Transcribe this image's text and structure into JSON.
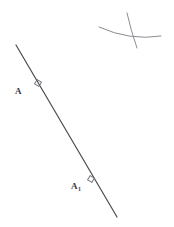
{
  "figure": {
    "background_color": "#ffffff",
    "stroke_color": "#4a4a52",
    "arc_color": "#8c8c94",
    "label_color": "#3a3a42",
    "canvas": {
      "width": 174,
      "height": 227
    },
    "main_line": {
      "name": "main-diagonal-line",
      "x1": 16,
      "y1": 45,
      "x2": 117,
      "y2": 217,
      "stroke_width": 1.2
    },
    "tick_markers": [
      {
        "name": "tick-marker-A",
        "cx": 38,
        "cy": 83,
        "size": 5,
        "rotation": -59
      },
      {
        "name": "tick-marker-A1",
        "cx": 91,
        "cy": 179,
        "size": 5,
        "rotation": -59
      }
    ],
    "labels": [
      {
        "id": "A",
        "base": "A",
        "subscript": "",
        "x": 15,
        "y": 81
      },
      {
        "id": "A1",
        "base": "A",
        "subscript": "1",
        "x": 71,
        "y": 176
      }
    ],
    "arcs": [
      {
        "name": "shallow-arc",
        "path": "M 99 27 Q 130 41 161 36",
        "stroke_width": 1.0
      },
      {
        "name": "steep-arc",
        "path": "M 127 13 Q 131 31 137 48",
        "stroke_width": 1.0
      }
    ]
  }
}
